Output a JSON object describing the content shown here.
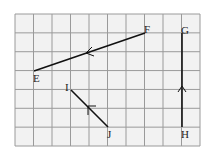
{
  "diagram": {
    "grid": {
      "cols": 10,
      "rows": 7,
      "x0": 15,
      "y0": 14,
      "x1": 200,
      "y1": 146,
      "line_color": "#9a9a9a",
      "fill": "#f2f2f2"
    },
    "segments": [
      {
        "name": "segment-fe",
        "from": "F",
        "to": "E",
        "x1": 145,
        "y1": 33,
        "x2": 34,
        "y2": 71
      },
      {
        "name": "segment-hg",
        "from": "H",
        "to": "G",
        "x1": 182,
        "y1": 127,
        "x2": 182,
        "y2": 33
      },
      {
        "name": "segment-ji",
        "from": "J",
        "to": "I",
        "x1": 108,
        "y1": 127,
        "x2": 71,
        "y2": 90
      }
    ],
    "labels": {
      "E": "E",
      "F": "F",
      "G": "G",
      "H": "H",
      "I": "I",
      "J": "J"
    },
    "line_color": "#111111"
  }
}
